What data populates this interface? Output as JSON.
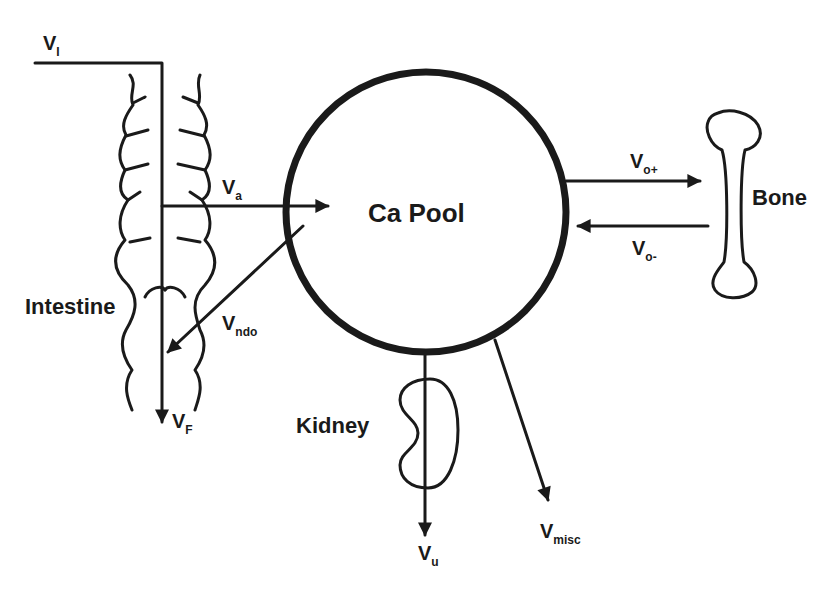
{
  "colors": {
    "ink": "#1a1a1a",
    "background": "#ffffff"
  },
  "nodes": {
    "pool": "Ca Pool",
    "intestine": "Intestine",
    "bone": "Bone",
    "kidney": "Kidney"
  },
  "fluxes": {
    "intake": {
      "main": "V",
      "sub": "I"
    },
    "absorption": {
      "main": "V",
      "sub": "a"
    },
    "endogenous": {
      "main": "V",
      "sub": "ndo"
    },
    "fecal": {
      "main": "V",
      "sub": "F"
    },
    "bone_in": {
      "main": "V",
      "sub": "o+"
    },
    "bone_out": {
      "main": "V",
      "sub": "o-"
    },
    "urinary": {
      "main": "V",
      "sub": "u"
    },
    "misc": {
      "main": "V",
      "sub": "misc"
    }
  }
}
